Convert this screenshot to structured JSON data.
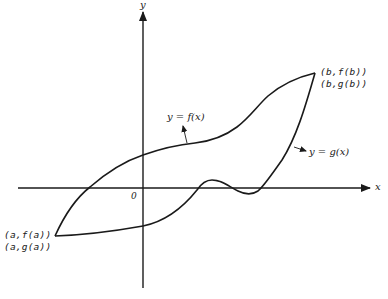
{
  "diagram": {
    "axes": {
      "x_label": "x",
      "y_label": "y",
      "origin_label": "0"
    },
    "curves": [
      {
        "name": "f",
        "label": "y = f(x)"
      },
      {
        "name": "g",
        "label": "y = g(x)"
      }
    ],
    "endpoints": {
      "left": {
        "line1": "(a,f(a))",
        "line2": "(a,g(a))"
      },
      "right": {
        "line1": "(b,f(b))",
        "line2": "(b,g(b))"
      }
    },
    "colors": {
      "ink": "#1a1a1a",
      "background": "#ffffff"
    }
  }
}
